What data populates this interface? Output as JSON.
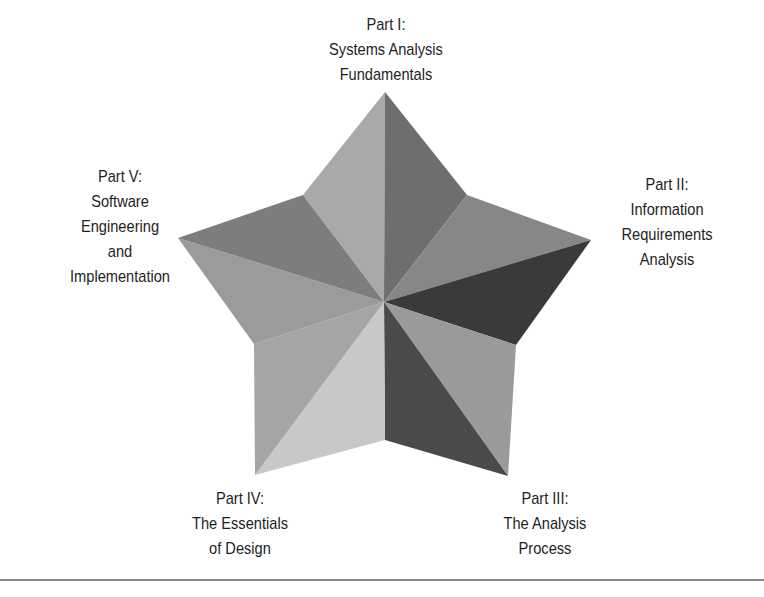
{
  "diagram": {
    "type": "five-point star",
    "center": [
      384,
      302
    ],
    "parts": [
      {
        "id": "part-1",
        "lines": [
          "Part I:",
          "Systems Analysis",
          "Fundamentals"
        ],
        "position": "top"
      },
      {
        "id": "part-2",
        "lines": [
          "Part II:",
          "Information",
          "Requirements",
          "Analysis"
        ],
        "position": "right"
      },
      {
        "id": "part-3",
        "lines": [
          "Part III:",
          "The Analysis",
          "Process"
        ],
        "position": "bottom-right"
      },
      {
        "id": "part-4",
        "lines": [
          "Part IV:",
          "The Essentials",
          "of Design"
        ],
        "position": "bottom-left"
      },
      {
        "id": "part-5",
        "lines": [
          "Part V:",
          "Software",
          "Engineering",
          "and",
          "Implementation"
        ],
        "position": "left"
      }
    ],
    "facet_colors": {
      "top_left": "#a9a9a9",
      "top_right": "#6e6e6e",
      "right_upper": "#878787",
      "right_lower": "#3a3a3a",
      "bottom_right_inner": "#4a4a4a",
      "bottom_right_outer": "#9a9a9a",
      "bottom_left_inner": "#c8c8c8",
      "bottom_left_outer": "#a5a5a5",
      "left_lower": "#9b9b9b",
      "left_upper": "#7d7d7d"
    }
  }
}
